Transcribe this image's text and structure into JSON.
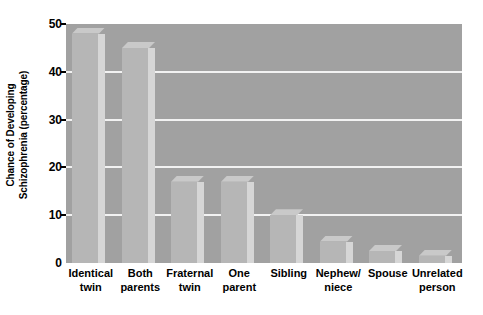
{
  "chart_data": {
    "type": "bar",
    "title": "",
    "xlabel": "",
    "ylabel": "Chance of Developing Schizophrenia (percentage)",
    "ylabel_lines": [
      "Chance of Developing",
      "Schizophrenia (percentage)"
    ],
    "categories": [
      "Identical twin",
      "Both parents",
      "Fraternal twin",
      "One parent",
      "Sibling",
      "Nephew/ niece",
      "Spouse",
      "Unrelated person"
    ],
    "category_lines": [
      [
        "Identical",
        "twin"
      ],
      [
        "Both",
        "parents"
      ],
      [
        "Fraternal",
        "twin"
      ],
      [
        "One",
        "parent"
      ],
      [
        "Sibling",
        ""
      ],
      [
        "Nephew/",
        "niece"
      ],
      [
        "Spouse",
        ""
      ],
      [
        "Unrelated",
        "person"
      ]
    ],
    "values": [
      48,
      45,
      17,
      17,
      10,
      4.5,
      2.5,
      1.5
    ],
    "ylim": [
      0,
      50
    ],
    "yticks": [
      0,
      10,
      20,
      30,
      40,
      50
    ],
    "ytick_labels": [
      "0",
      "10",
      "20",
      "30",
      "40",
      "50"
    ],
    "grid": true,
    "legend": "none",
    "colors": {
      "plot_background": "#a1a1a1",
      "bar_face": "#b6b6b6",
      "bar_side": "#d6d6d6",
      "bar_top": "#c9c9c9",
      "gridline": "#f2f2f2",
      "text": "#000000",
      "page_background": "#ffffff"
    }
  }
}
